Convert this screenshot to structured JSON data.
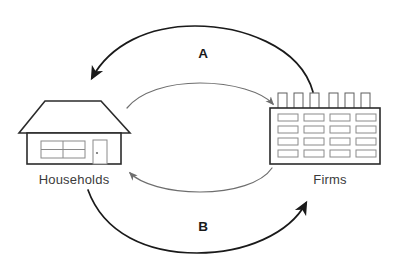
{
  "diagram": {
    "background_color": "#ffffff",
    "nodes": [
      {
        "id": "households",
        "label": "Households",
        "icon": "house-icon",
        "position": "left",
        "color": "#2b2b2b"
      },
      {
        "id": "firms",
        "label": "Firms",
        "icon": "factory-icon",
        "position": "right",
        "color": "#2b2b2b"
      }
    ],
    "flows": [
      {
        "id": "flow-a",
        "label": "A",
        "from": "firms",
        "to": "households",
        "path": "outer-top",
        "style": "dark",
        "color": "#1a1a1a"
      },
      {
        "id": "flow-inner-top",
        "label": "",
        "from": "households",
        "to": "firms",
        "path": "inner-top",
        "style": "light",
        "color": "#6e6e6e"
      },
      {
        "id": "flow-inner-bottom",
        "label": "",
        "from": "firms",
        "to": "households",
        "path": "inner-bottom",
        "style": "light",
        "color": "#6e6e6e"
      },
      {
        "id": "flow-b",
        "label": "B",
        "from": "households",
        "to": "firms",
        "path": "outer-bottom",
        "style": "dark",
        "color": "#1a1a1a"
      }
    ],
    "house": {
      "windows": 1,
      "window_panes": 4,
      "doors": 1,
      "roof": "trapezoid"
    },
    "factory": {
      "chimneys": 6,
      "window_rows": 4,
      "window_columns": 4
    }
  }
}
